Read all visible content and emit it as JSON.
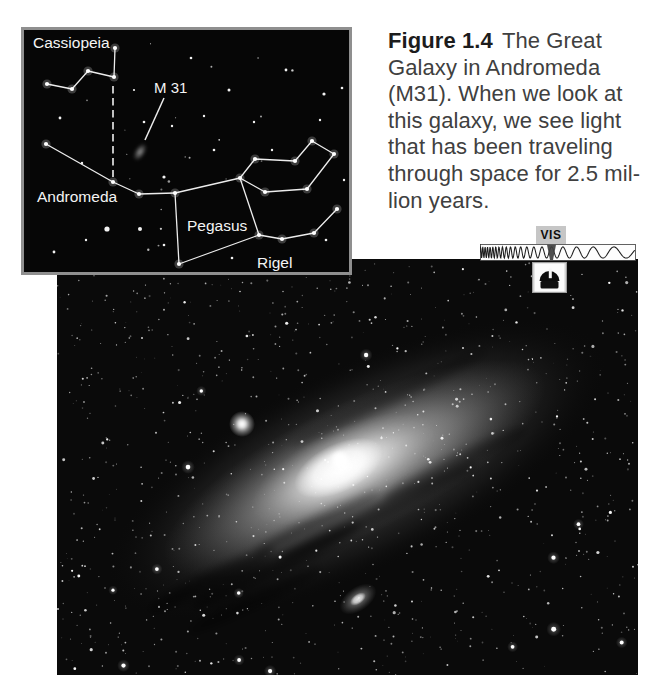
{
  "figure_caption": {
    "label": "Figure 1.4",
    "first_line_rest": "The Great",
    "lines": [
      "Galaxy in Andromeda",
      "(M31). When we look at",
      "this galaxy, we see light",
      "that has been traveling",
      "through space for 2.5 mil-",
      "lion years."
    ],
    "text_color": "#404040",
    "label_color": "#1c1c1c"
  },
  "star_chart": {
    "background": "#060606",
    "border_color": "#8f8f8f",
    "line_color": "#ececec",
    "label_color": "#f4f4f4",
    "labels": [
      {
        "id": "cassiopeia",
        "text": "Cassiopeia",
        "x": 9,
        "y": 18,
        "size": 15.5
      },
      {
        "id": "m31",
        "text": "M 31",
        "x": 130,
        "y": 63,
        "size": 15
      },
      {
        "id": "andromeda",
        "text": "Andromeda",
        "x": 13,
        "y": 172,
        "size": 15.5
      },
      {
        "id": "pegasus",
        "text": "Pegasus",
        "x": 163,
        "y": 201,
        "size": 15.5
      },
      {
        "id": "rigel",
        "text": "Rigel",
        "x": 233,
        "y": 238,
        "size": 15.5
      }
    ],
    "constellation_lines": [
      {
        "name": "cassiopeia-w",
        "points": [
          [
            23,
            54
          ],
          [
            48,
            59
          ],
          [
            64,
            41
          ],
          [
            90,
            47
          ],
          [
            91,
            18
          ]
        ]
      },
      {
        "name": "andromeda-chain",
        "points": [
          [
            22,
            114
          ],
          [
            89,
            152
          ],
          [
            115,
            164
          ],
          [
            151,
            163
          ]
        ]
      },
      {
        "name": "great-square-of-pegasus",
        "points": [
          [
            151,
            163
          ],
          [
            216,
            148
          ],
          [
            235,
            205
          ],
          [
            155,
            234
          ],
          [
            151,
            163
          ]
        ]
      },
      {
        "name": "north-east-chain",
        "points": [
          [
            216,
            148
          ],
          [
            231,
            129
          ],
          [
            271,
            131
          ],
          [
            288,
            111
          ],
          [
            310,
            124
          ]
        ]
      },
      {
        "name": "east-chain",
        "points": [
          [
            216,
            148
          ],
          [
            241,
            162
          ],
          [
            283,
            159
          ],
          [
            310,
            124
          ]
        ]
      },
      {
        "name": "south-east-chain",
        "points": [
          [
            235,
            205
          ],
          [
            258,
            209
          ],
          [
            290,
            203
          ],
          [
            313,
            179
          ]
        ]
      }
    ],
    "dashed_pointer": {
      "x": 89,
      "y1": 56,
      "y2": 147
    },
    "m31_marker": {
      "cx": 116,
      "cy": 122,
      "rx": 10,
      "ry": 5.5,
      "rotate": -58
    },
    "m31_pointer_line": {
      "x1": 140,
      "y1": 68,
      "x2": 121,
      "y2": 110
    },
    "extra_stars": [
      {
        "x": 83,
        "y": 199,
        "r": 2.6
      },
      {
        "x": 116,
        "y": 199,
        "r": 2.0
      },
      {
        "x": 140,
        "y": 147,
        "r": 1.6
      },
      {
        "x": 205,
        "y": 60,
        "r": 1.5
      },
      {
        "x": 262,
        "y": 40,
        "r": 1.4
      },
      {
        "x": 300,
        "y": 64,
        "r": 1.6
      },
      {
        "x": 36,
        "y": 88,
        "r": 1.4
      },
      {
        "x": 120,
        "y": 92,
        "r": 1.3
      },
      {
        "x": 167,
        "y": 28,
        "r": 1.3
      },
      {
        "x": 230,
        "y": 92,
        "r": 1.2
      },
      {
        "x": 58,
        "y": 133,
        "r": 1.2
      },
      {
        "x": 190,
        "y": 120,
        "r": 1.3
      },
      {
        "x": 318,
        "y": 58,
        "r": 1.3
      },
      {
        "x": 296,
        "y": 90,
        "r": 1.2
      },
      {
        "x": 248,
        "y": 120,
        "r": 1.2
      },
      {
        "x": 30,
        "y": 222,
        "r": 1.4
      },
      {
        "x": 62,
        "y": 210,
        "r": 1.2
      },
      {
        "x": 140,
        "y": 215,
        "r": 1.3
      },
      {
        "x": 208,
        "y": 228,
        "r": 1.3
      },
      {
        "x": 302,
        "y": 210,
        "r": 1.3
      },
      {
        "x": 320,
        "y": 150,
        "r": 1.2
      },
      {
        "x": 148,
        "y": 96,
        "r": 1.2
      },
      {
        "x": 110,
        "y": 60,
        "r": 1.1
      },
      {
        "x": 180,
        "y": 86,
        "r": 1.2
      }
    ]
  },
  "spectrum_indicator": {
    "band_label": "VIS",
    "label_background": "#c6c6c6",
    "label_color": "#0e0e0e",
    "strip_background": "#fdfdfd",
    "wave_color": "#1d1d1d",
    "marker_color": "#3f3f3f",
    "icon": "observatory-dome-icon"
  },
  "photo": {
    "background": "#0a0a0a",
    "objects": [
      {
        "name": "andromeda-galaxy-disk",
        "cx": 300,
        "cy": 210,
        "rotate": -26
      },
      {
        "name": "galaxy-core",
        "cx": 283,
        "cy": 201
      },
      {
        "name": "bright-companion-galaxy",
        "cx": 185,
        "cy": 165
      },
      {
        "name": "faint-companion-galaxy",
        "cx": 301,
        "cy": 340,
        "rotate": -35
      }
    ]
  }
}
